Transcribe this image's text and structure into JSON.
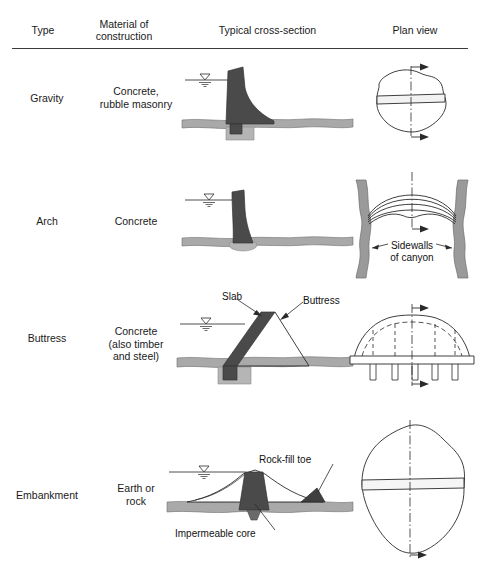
{
  "table": {
    "headers": {
      "type": "Type",
      "material_line1": "Material of",
      "material_line2": "construction",
      "cross_section": "Typical cross-section",
      "plan_view": "Plan view"
    },
    "rows": [
      {
        "type": "Gravity",
        "material_line1": "Concrete,",
        "material_line2": "rubble masonry",
        "material_line3": "",
        "annotations": []
      },
      {
        "type": "Arch",
        "material_line1": "Concrete",
        "material_line2": "",
        "material_line3": "",
        "annotations": [
          {
            "text_line1": "Sidewalls",
            "text_line2": "of canyon"
          }
        ]
      },
      {
        "type": "Buttress",
        "material_line1": "Concrete",
        "material_line2": "(also timber",
        "material_line3": "and steel)",
        "annotations": [
          {
            "text_line1": "Slab",
            "text_line2": ""
          },
          {
            "text_line1": "Buttress",
            "text_line2": ""
          }
        ]
      },
      {
        "type": "Embankment",
        "material_line1": "Earth or",
        "material_line2": "rock",
        "material_line3": "",
        "annotations": [
          {
            "text_line1": "Rock-fill toe",
            "text_line2": ""
          },
          {
            "text_line1": "Impermeable core",
            "text_line2": ""
          }
        ]
      }
    ]
  },
  "labels": {
    "slab": "Slab",
    "buttress": "Buttress",
    "sidewalls_1": "Sidewalls",
    "sidewalls_2": "of canyon",
    "rockfill_toe": "Rock-fill toe",
    "impermeable_core": "Impermeable core"
  },
  "colors": {
    "dam_fill": "#4a4a4a",
    "ground_fill": "#a9a9a9",
    "canyon_wall": "#9a9a9a",
    "outline": "#2a2a2a",
    "text": "#1a1a1a"
  }
}
